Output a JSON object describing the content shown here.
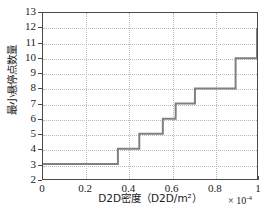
{
  "chart_data": {
    "type": "line",
    "line_style": "step-post",
    "title": "",
    "xlabel": "D2D密度（D2D/m²）",
    "ylabel": "最小悬停点数量",
    "x_multiplier": "× 10",
    "x_multiplier_exponent": "-4",
    "xlim": [
      0,
      1
    ],
    "ylim": [
      2,
      13
    ],
    "xticks": [
      0,
      0.2,
      0.4,
      0.6,
      0.8,
      1
    ],
    "xtick_labels": [
      "0",
      "0.2",
      "0.4",
      "0.6",
      "0.8",
      "1"
    ],
    "yticks": [
      2,
      3,
      4,
      5,
      6,
      7,
      8,
      9,
      10,
      11,
      12,
      13
    ],
    "ytick_labels": [
      "2",
      "3",
      "4",
      "5",
      "6",
      "7",
      "8",
      "9",
      "10",
      "11",
      "12",
      "13"
    ],
    "grid": true,
    "grid_style": "dotted",
    "legend": null,
    "series": [
      {
        "name": "最小悬停点数量",
        "color": "#808080",
        "line_width": 2,
        "x": [
          0.0,
          0.35,
          0.35,
          0.45,
          0.45,
          0.56,
          0.56,
          0.62,
          0.62,
          0.71,
          0.71,
          0.9,
          0.9,
          1.0,
          1.0
        ],
        "y": [
          3,
          3,
          4,
          4,
          5,
          5,
          6,
          6,
          7,
          7,
          8,
          8,
          10,
          10,
          12
        ]
      }
    ],
    "step_points": [
      {
        "x": 0.0,
        "y": 3
      },
      {
        "x": 0.35,
        "y": 4
      },
      {
        "x": 0.45,
        "y": 5
      },
      {
        "x": 0.56,
        "y": 6
      },
      {
        "x": 0.62,
        "y": 7
      },
      {
        "x": 0.71,
        "y": 8
      },
      {
        "x": 0.9,
        "y": 10
      },
      {
        "x": 1.0,
        "y": 12
      }
    ],
    "colors": {
      "line": "#808080",
      "axis": "#4a4a4a",
      "grid": "#b9b9b9",
      "text": "#1a1a1a",
      "background": "#ffffff"
    }
  }
}
